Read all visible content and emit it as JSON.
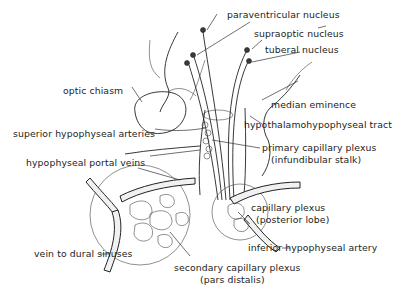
{
  "diagram": {
    "labels": {
      "paraventricular": "paraventricular nucleus",
      "supraoptic": "supraoptic nucleus",
      "tuberal": "tuberal nucleus",
      "optic_chiasm": "optic chiasm",
      "median_eminence": "median eminence",
      "superior_arteries": "superior hypophyseal arteries",
      "tract": "hypothalamohypophyseal tract",
      "primary_plexus": "primary capillary plexus",
      "primary_plexus_sub": "(infundibular stalk)",
      "portal_veins": "hypophyseal portal veins",
      "capillary_plexus": "capillary plexus",
      "capillary_plexus_sub": "(posterior lobe)",
      "inferior_artery": "inferior hypophyseal artery",
      "vein_dural": "vein to dural sinuses",
      "secondary_plexus": "secondary capillary plexus",
      "secondary_plexus_sub": "(pars distalis)"
    }
  }
}
